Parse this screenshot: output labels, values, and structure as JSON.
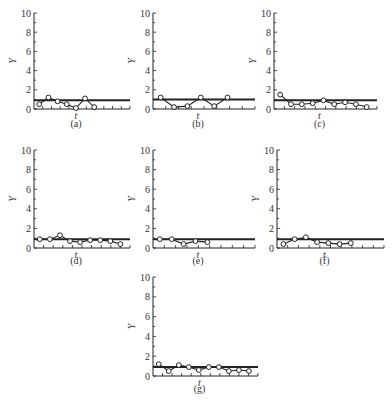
{
  "figure": {
    "background": "#ffffff",
    "line_color": "#222222",
    "marker_fill": "#ffffff"
  },
  "chart_data": [
    {
      "type": "line",
      "panel": "(a)",
      "xlabel": "t",
      "ylabel": "Y",
      "ylim": [
        0,
        10
      ],
      "yticks": [
        0,
        2,
        4,
        6,
        8,
        10
      ],
      "reference_line": 0.9,
      "x": [
        1,
        2,
        3,
        4,
        5,
        6,
        7
      ],
      "values": [
        0.5,
        1.2,
        0.8,
        0.5,
        0.1,
        1.1,
        0.2
      ],
      "grid": false
    },
    {
      "type": "line",
      "panel": "(b)",
      "xlabel": "t",
      "ylabel": "Y",
      "ylim": [
        0,
        10
      ],
      "yticks": [
        0,
        2,
        4,
        6,
        8,
        10
      ],
      "reference_line": 1.0,
      "x": [
        1,
        2,
        3,
        4,
        5,
        6
      ],
      "values": [
        1.2,
        0.2,
        0.3,
        1.2,
        0.3,
        1.2
      ],
      "grid": false
    },
    {
      "type": "line",
      "panel": "(c)",
      "xlabel": "t",
      "ylabel": "Y",
      "ylim": [
        0,
        10
      ],
      "yticks": [
        0,
        2,
        4,
        6,
        8,
        10
      ],
      "reference_line": 0.9,
      "x": [
        1,
        2,
        3,
        4,
        5,
        6,
        7,
        8,
        9
      ],
      "values": [
        1.5,
        0.5,
        0.5,
        0.6,
        0.9,
        0.5,
        0.7,
        0.5,
        0.2
      ],
      "grid": false
    },
    {
      "type": "line",
      "panel": "(d)",
      "xlabel": "t",
      "ylabel": "Y",
      "ylim": [
        0,
        10
      ],
      "yticks": [
        0,
        2,
        4,
        6,
        8,
        10
      ],
      "reference_line": 0.9,
      "x": [
        1,
        2,
        3,
        4,
        5,
        6,
        7,
        8,
        9
      ],
      "values": [
        0.9,
        0.9,
        1.3,
        0.7,
        0.6,
        0.8,
        0.8,
        0.7,
        0.4
      ],
      "grid": false
    },
    {
      "type": "line",
      "panel": "(e)",
      "xlabel": "t",
      "ylabel": "Y",
      "ylim": [
        0,
        10
      ],
      "yticks": [
        0,
        2,
        4,
        6,
        8,
        10
      ],
      "reference_line": 0.9,
      "x": [
        1,
        2,
        3,
        4,
        5
      ],
      "values": [
        0.9,
        0.9,
        0.4,
        0.7,
        0.6
      ],
      "grid": false
    },
    {
      "type": "line",
      "panel": "(f)",
      "xlabel": "t",
      "ylabel": "Y",
      "ylim": [
        0,
        10
      ],
      "yticks": [
        0,
        2,
        4,
        6,
        8,
        10
      ],
      "reference_line": 0.9,
      "x": [
        1,
        2,
        3,
        4,
        5,
        6,
        7
      ],
      "values": [
        0.4,
        0.9,
        1.1,
        0.6,
        0.5,
        0.4,
        0.5
      ],
      "grid": false
    },
    {
      "type": "line",
      "panel": "(g)",
      "xlabel": "t",
      "ylabel": "Y",
      "ylim": [
        0,
        10
      ],
      "yticks": [
        0,
        2,
        4,
        6,
        8,
        10
      ],
      "reference_line": 0.9,
      "x": [
        1,
        2,
        3,
        4,
        5,
        6,
        7,
        8,
        9,
        10
      ],
      "values": [
        1.2,
        0.5,
        1.1,
        0.9,
        0.6,
        0.9,
        0.9,
        0.5,
        0.6,
        0.5
      ],
      "grid": false
    }
  ],
  "layout": [
    {
      "ax": 34,
      "top": 13,
      "bottom": 109,
      "right": 130,
      "n_ticks": 11,
      "label_y": 127
    },
    {
      "ax": 153,
      "top": 13,
      "bottom": 109,
      "right": 255,
      "n_ticks": 8,
      "label_y": 127
    },
    {
      "ax": 274,
      "top": 13,
      "bottom": 109,
      "right": 377,
      "n_ticks": 10,
      "label_y": 127
    },
    {
      "ax": 34,
      "top": 150,
      "bottom": 248,
      "right": 130,
      "n_ticks": 10,
      "label_y": 264
    },
    {
      "ax": 153,
      "top": 150,
      "bottom": 248,
      "right": 255,
      "n_ticks": 9,
      "label_y": 264
    },
    {
      "ax": 277,
      "top": 150,
      "bottom": 248,
      "right": 384,
      "n_ticks": 10,
      "label_y": 264
    },
    {
      "ax": 153,
      "top": 277,
      "bottom": 376,
      "right": 258,
      "n_ticks": 11,
      "label_y": 392
    }
  ]
}
